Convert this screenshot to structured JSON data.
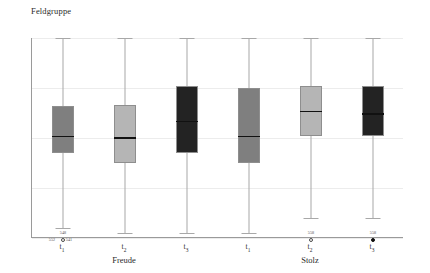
{
  "chart_data": {
    "type": "box",
    "title": "Feldgruppe",
    "xlabel": "",
    "ylabel": "",
    "ylim": [
      1,
      5
    ],
    "yticks": [
      5,
      4,
      3,
      2,
      1
    ],
    "grid": true,
    "legend": "none",
    "group_labels": [
      "Freude",
      "Stolz"
    ],
    "categories": [
      "t1",
      "t2",
      "t3",
      "t1",
      "t2",
      "t3"
    ],
    "category_labels": [
      "t",
      "t",
      "t",
      "t",
      "t",
      "t"
    ],
    "category_subscripts": [
      "1",
      "2",
      "3",
      "1",
      "2",
      "3"
    ],
    "boxes": [
      {
        "name": "freude-t1",
        "group": "Freude",
        "tick": "t1",
        "fill": "#7f7f7f",
        "whisker_low": 1.2,
        "q1": 2.7,
        "median": 3.05,
        "q3": 3.65,
        "whisker_high": 5.0,
        "outliers": [
          {
            "value": 1.05,
            "label": "548",
            "style": "hollow",
            "label_pos": "above"
          },
          {
            "value": 1.0,
            "label": "552",
            "style": "none",
            "label_pos": "left"
          },
          {
            "value": 1.0,
            "label": "541",
            "style": "none",
            "label_pos": "right"
          }
        ]
      },
      {
        "name": "freude-t2",
        "group": "Freude",
        "tick": "t2",
        "fill": "#b5b5b5",
        "whisker_low": 1.1,
        "q1": 2.5,
        "median": 3.02,
        "q3": 3.67,
        "whisker_high": 5.0,
        "outliers": []
      },
      {
        "name": "freude-t3",
        "group": "Freude",
        "tick": "t3",
        "fill": "#232323",
        "whisker_low": 1.1,
        "q1": 2.7,
        "median": 3.35,
        "q3": 4.05,
        "whisker_high": 5.0,
        "outliers": []
      },
      {
        "name": "stolz-t1",
        "group": "Stolz",
        "tick": "t1",
        "fill": "#7f7f7f",
        "whisker_low": 1.1,
        "q1": 2.5,
        "median": 3.05,
        "q3": 4.0,
        "whisker_high": 5.0,
        "outliers": []
      },
      {
        "name": "stolz-t2",
        "group": "Stolz",
        "tick": "t2",
        "fill": "#b5b5b5",
        "whisker_low": 1.4,
        "q1": 3.05,
        "median": 3.55,
        "q3": 4.05,
        "whisker_high": 5.0,
        "outliers": [
          {
            "value": 1.05,
            "label": "558",
            "style": "hollow",
            "label_pos": "above"
          }
        ]
      },
      {
        "name": "stolz-t3",
        "group": "Stolz",
        "tick": "t3",
        "fill": "#232323",
        "whisker_low": 1.4,
        "q1": 3.05,
        "median": 3.5,
        "q3": 4.05,
        "whisker_high": 5.0,
        "outliers": [
          {
            "value": 1.05,
            "label": "558",
            "style": "filled",
            "label_pos": "above"
          }
        ]
      }
    ]
  },
  "colors": {
    "axis": "#9a9a9a",
    "grid": "#ececec",
    "whisker": "#a8a8a8",
    "median": "#111111",
    "text": "#2a2a2a"
  }
}
